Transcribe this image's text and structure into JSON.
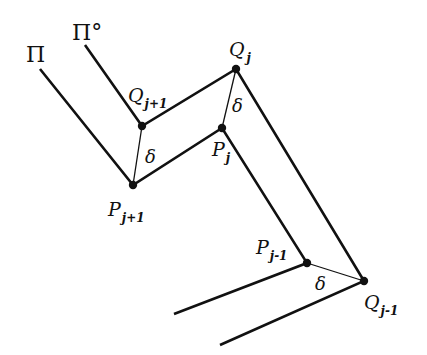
{
  "diagram": {
    "colors": {
      "line": "#111111",
      "background": "#ffffff"
    },
    "curves": {
      "pi": {
        "label": "Π",
        "points": [
          [
            40,
            69
          ],
          [
            133,
            185
          ],
          [
            222,
            128
          ],
          [
            307,
            263
          ],
          [
            174,
            314
          ]
        ]
      },
      "pi_circ": {
        "label": "Π°",
        "points": [
          [
            85,
            45
          ],
          [
            142,
            126
          ],
          [
            236,
            69
          ],
          [
            364,
            281
          ],
          [
            220,
            345
          ]
        ]
      }
    },
    "vertices": [
      {
        "id": "Q_j+1",
        "main": "Q",
        "sub": "j+1",
        "x": 142,
        "y": 126
      },
      {
        "id": "P_j+1",
        "main": "P",
        "sub": "j+1",
        "x": 133,
        "y": 185
      },
      {
        "id": "Q_j",
        "main": "Q",
        "sub": "j",
        "x": 236,
        "y": 69
      },
      {
        "id": "P_j",
        "main": "P",
        "sub": "j",
        "x": 222,
        "y": 128
      },
      {
        "id": "P_j-1",
        "main": "P",
        "sub": "j-1",
        "x": 307,
        "y": 263
      },
      {
        "id": "Q_j-1",
        "main": "Q",
        "sub": "j-1",
        "x": 364,
        "y": 281
      }
    ],
    "connectors": [
      {
        "from": "Q_j+1",
        "to": "P_j+1",
        "label": "δ"
      },
      {
        "from": "Q_j",
        "to": "P_j",
        "label": "δ"
      },
      {
        "from": "P_j-1",
        "to": "Q_j-1",
        "label": "δ"
      }
    ],
    "labels": {
      "pi": "Π",
      "pi_circ": "Π°",
      "q_j1_main": "Q",
      "q_j1_sub": "j+1",
      "p_j1_main": "P",
      "p_j1_sub": "j+1",
      "q_j_main": "Q",
      "q_j_sub": "j",
      "p_j_main": "P",
      "p_j_sub": "j",
      "p_jm1_main": "P",
      "p_jm1_sub": "j-1",
      "q_jm1_main": "Q",
      "q_jm1_sub": "j-1",
      "delta": "δ"
    }
  }
}
